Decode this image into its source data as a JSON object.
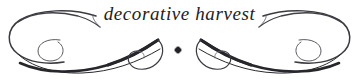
{
  "ornament": {
    "title": "decorative harvest",
    "center_dot": "diamond-dot",
    "colors": {
      "background": "#ffffff",
      "ink": "#2a2a2e",
      "ink_light": "#53535a",
      "text": "#1d1d20"
    },
    "icons": {
      "left_flourish": "flourish-swash-left-icon",
      "right_flourish": "flourish-swash-right-icon",
      "left_arc": "arc-curl-left-icon",
      "right_arc": "arc-curl-right-icon",
      "center": "diamond-dot-icon"
    },
    "geometry": {
      "width": 359,
      "height": 80,
      "center_x": 178,
      "center_y": 50,
      "left_extent": 8,
      "right_extent": 352
    }
  }
}
